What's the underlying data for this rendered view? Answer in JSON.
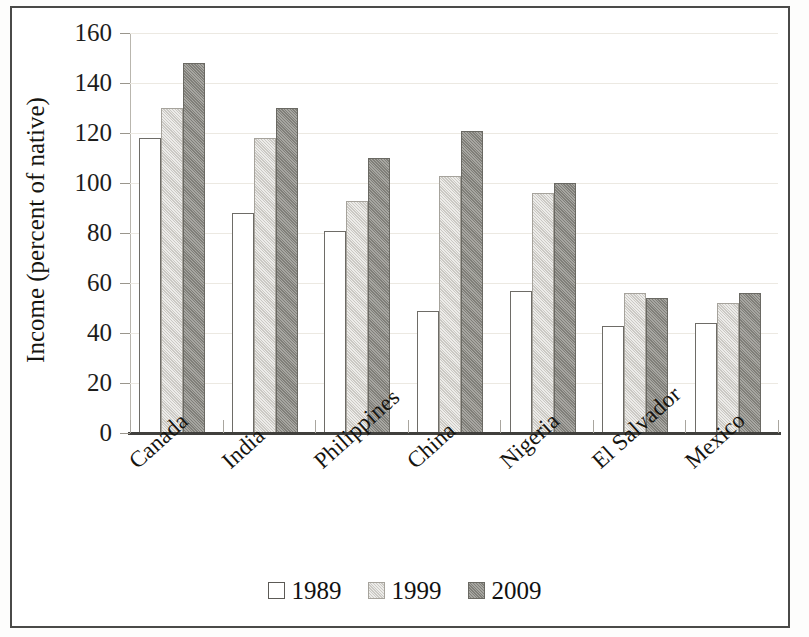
{
  "chart_data": {
    "type": "bar",
    "title": "",
    "xlabel": "",
    "ylabel": "Income (percent of native)",
    "ylim": [
      0,
      160
    ],
    "yticks": [
      0,
      20,
      40,
      60,
      80,
      100,
      120,
      140,
      160
    ],
    "grid": true,
    "legend_position": "bottom",
    "categories": [
      "Canada",
      "India",
      "Philippines",
      "China",
      "Nigeria",
      "El Salvador",
      "Mexico"
    ],
    "series": [
      {
        "name": "1989",
        "color": "#ffffff",
        "values": [
          118,
          88,
          81,
          49,
          57,
          43,
          44
        ]
      },
      {
        "name": "1999",
        "color": "#d6d4cf",
        "values": [
          130,
          118,
          93,
          103,
          96,
          56,
          52
        ]
      },
      {
        "name": "2009",
        "color": "#8e8d87",
        "values": [
          148,
          130,
          110,
          121,
          100,
          54,
          56
        ]
      }
    ]
  },
  "legend": {
    "items": [
      {
        "label": "1989",
        "swatch": "white-square-swatch"
      },
      {
        "label": "1999",
        "swatch": "light-gray-square-swatch"
      },
      {
        "label": "2009",
        "swatch": "dark-gray-square-swatch"
      }
    ]
  },
  "axis": {
    "y_title": "Income (percent of native)",
    "y_tick_labels": [
      "160",
      "140",
      "120",
      "100",
      "80",
      "60",
      "40",
      "20",
      "0"
    ],
    "x_tick_labels": [
      "Canada",
      "India",
      "Philippines",
      "China",
      "Nigeria",
      "El Salvador",
      "Mexico"
    ]
  },
  "colors": {
    "frame": "#4a4a48",
    "baseline": "#403f3c",
    "gridline": "#ece9e2",
    "series_1989": "#ffffff",
    "series_1999": "#d6d4cf",
    "series_2009": "#8e8d87",
    "text": "#15140f"
  }
}
